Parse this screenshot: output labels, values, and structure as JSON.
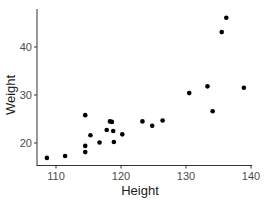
{
  "chart_data": {
    "type": "scatter",
    "title": "",
    "xlabel": "Height",
    "ylabel": "Weight",
    "xlim": [
      107.5,
      140.2
    ],
    "ylim": [
      15.5,
      47.5
    ],
    "xticks": [
      110,
      120,
      130,
      140
    ],
    "yticks": [
      20,
      30,
      40
    ],
    "grid": false,
    "legend": null,
    "point_color": "#000000",
    "points": [
      {
        "x": 108.6,
        "y": 16.9
      },
      {
        "x": 111.4,
        "y": 17.3
      },
      {
        "x": 114.5,
        "y": 25.8
      },
      {
        "x": 114.5,
        "y": 19.4
      },
      {
        "x": 114.5,
        "y": 18.1
      },
      {
        "x": 115.3,
        "y": 21.6
      },
      {
        "x": 116.7,
        "y": 20.1
      },
      {
        "x": 117.8,
        "y": 22.7
      },
      {
        "x": 118.3,
        "y": 24.5
      },
      {
        "x": 118.6,
        "y": 24.4
      },
      {
        "x": 118.8,
        "y": 22.5
      },
      {
        "x": 118.9,
        "y": 20.2
      },
      {
        "x": 120.2,
        "y": 21.8
      },
      {
        "x": 123.3,
        "y": 24.5
      },
      {
        "x": 124.8,
        "y": 23.6
      },
      {
        "x": 126.4,
        "y": 24.7
      },
      {
        "x": 130.5,
        "y": 30.4
      },
      {
        "x": 133.3,
        "y": 31.8
      },
      {
        "x": 134.1,
        "y": 26.6
      },
      {
        "x": 135.5,
        "y": 43.1
      },
      {
        "x": 136.2,
        "y": 46.1
      },
      {
        "x": 138.9,
        "y": 31.5
      }
    ]
  }
}
